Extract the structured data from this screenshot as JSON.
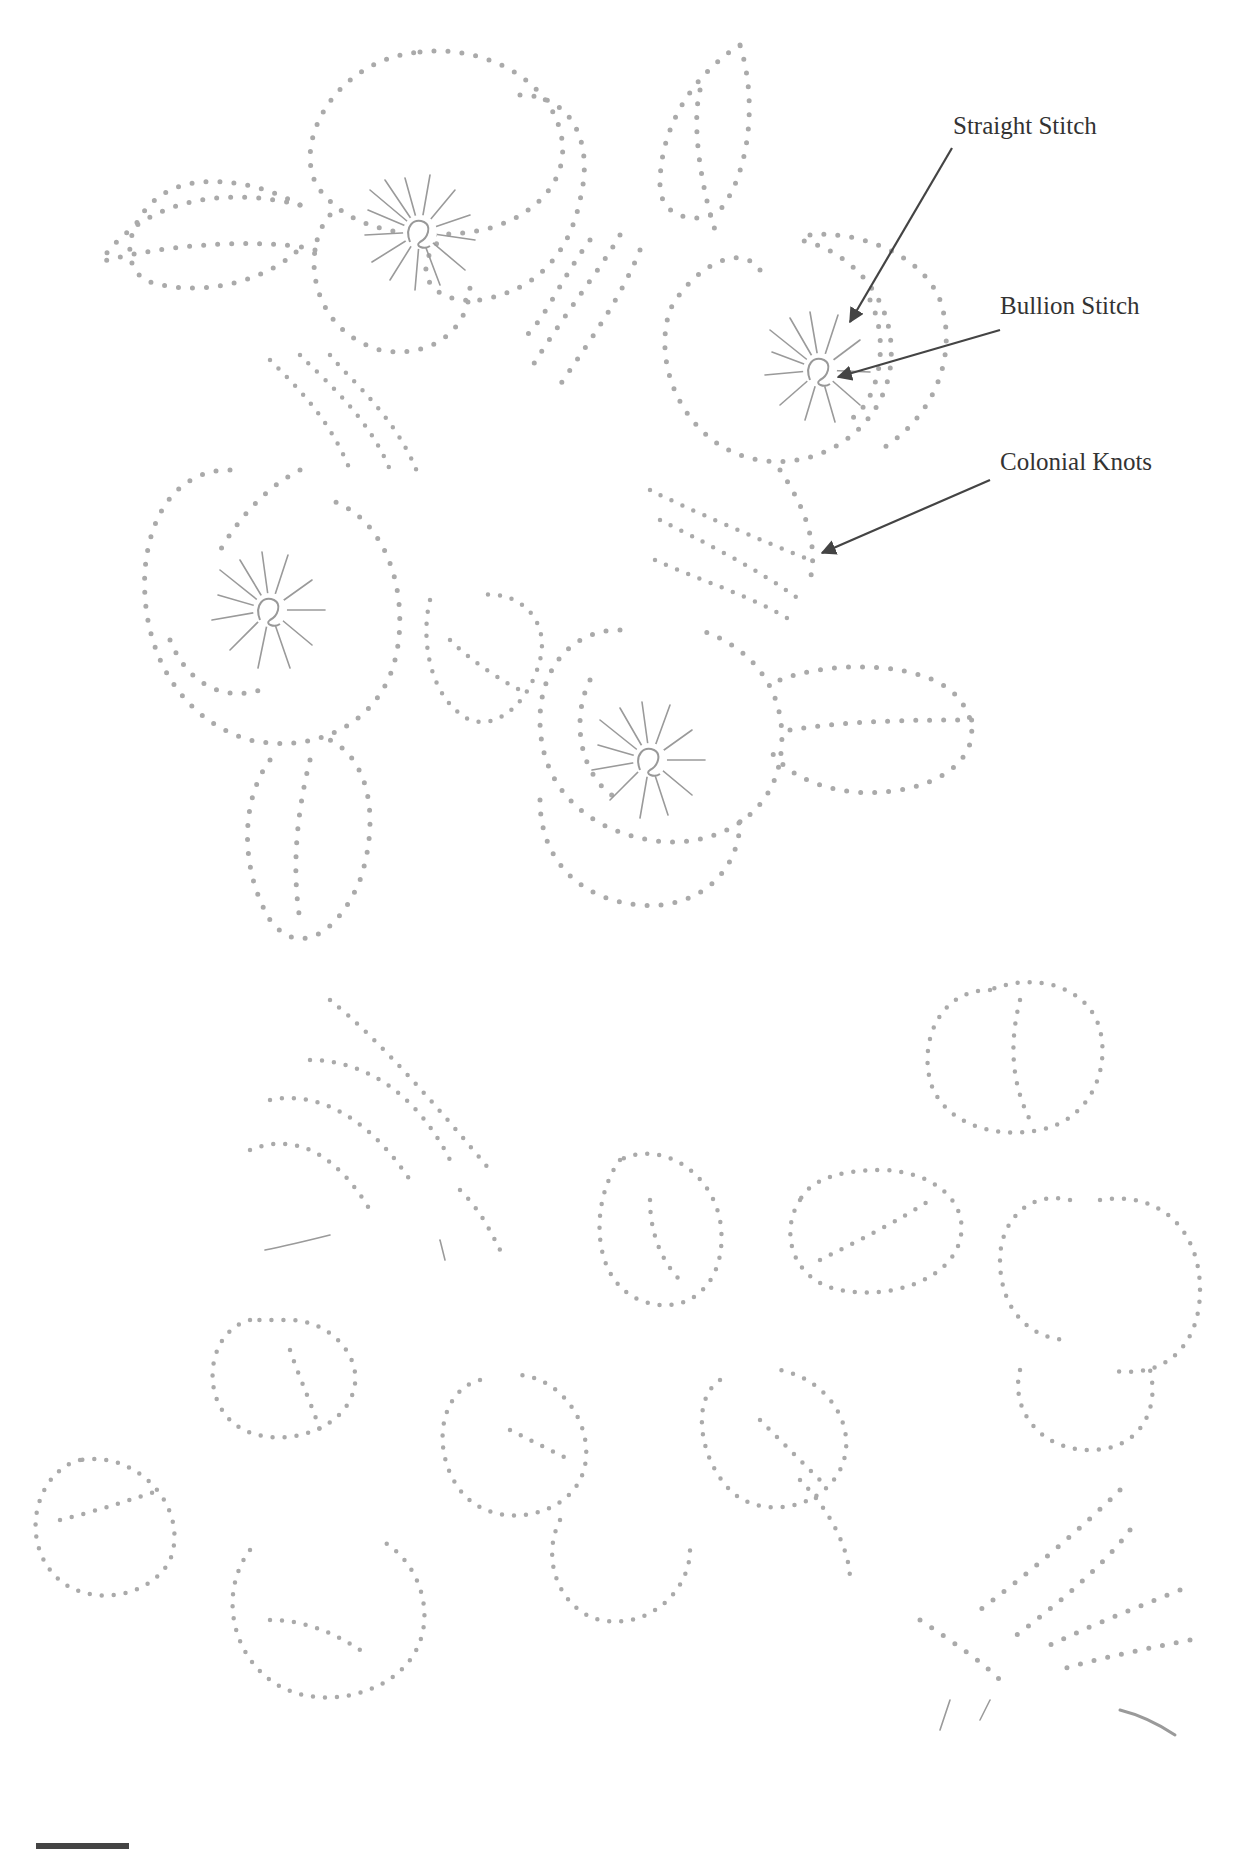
{
  "figure": {
    "type": "embroidery stitch pattern",
    "colors": {
      "dots": "#aaaaaa",
      "stitches": "#9a9a9a",
      "leader_lines": "#444444",
      "label_text": "#333333"
    }
  },
  "annotations": [
    {
      "label": "Straight Stitch",
      "x": 953,
      "y": 112
    },
    {
      "label": "Bullion Stitch",
      "x": 1000,
      "y": 292
    },
    {
      "label": "Colonial Knots",
      "x": 1000,
      "y": 448
    }
  ]
}
